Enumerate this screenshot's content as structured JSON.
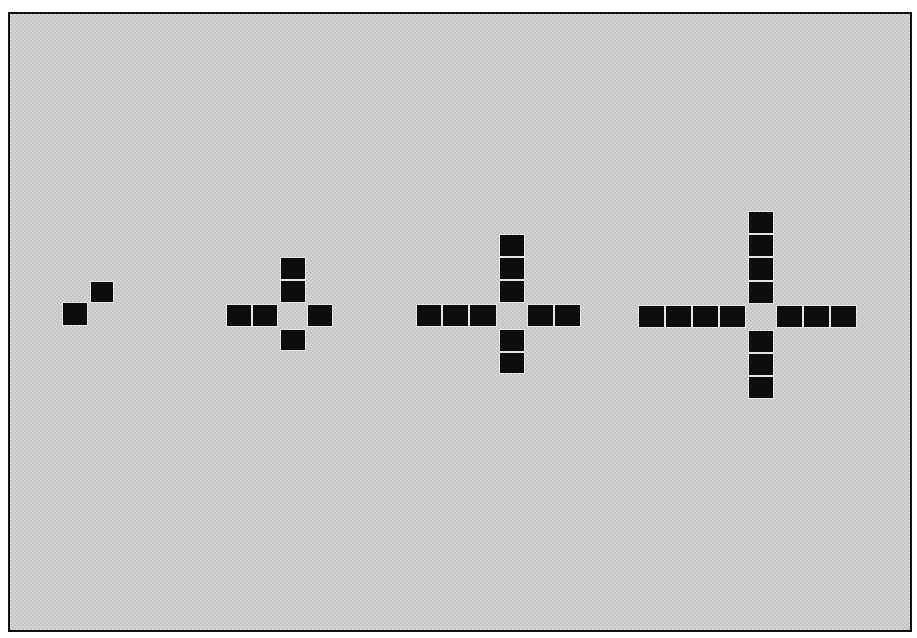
{
  "figure": {
    "background_color": "#d4d4d4",
    "border_color": "#111111",
    "cell_color": "#0d0d0d",
    "cell_size_px": 26
  },
  "shapes": [
    {
      "name": "shape-1-diagonal-pair",
      "cells": [
        {
          "x": 62,
          "y": 302,
          "w": 26,
          "h": 24
        },
        {
          "x": 90,
          "y": 281,
          "w": 24,
          "h": 22
        }
      ]
    },
    {
      "name": "shape-2-small-cross",
      "cells": [
        {
          "x": 280,
          "y": 257,
          "w": 26,
          "h": 23
        },
        {
          "x": 280,
          "y": 280,
          "w": 26,
          "h": 23
        },
        {
          "x": 226,
          "y": 304,
          "w": 26,
          "h": 23
        },
        {
          "x": 252,
          "y": 304,
          "w": 26,
          "h": 23
        },
        {
          "x": 307,
          "y": 304,
          "w": 26,
          "h": 23
        },
        {
          "x": 280,
          "y": 329,
          "w": 26,
          "h": 22
        }
      ]
    },
    {
      "name": "shape-3-medium-cross",
      "cells": [
        {
          "x": 499,
          "y": 234,
          "w": 26,
          "h": 23
        },
        {
          "x": 499,
          "y": 257,
          "w": 26,
          "h": 23
        },
        {
          "x": 499,
          "y": 280,
          "w": 26,
          "h": 23
        },
        {
          "x": 416,
          "y": 304,
          "w": 26,
          "h": 23
        },
        {
          "x": 442,
          "y": 304,
          "w": 27,
          "h": 23
        },
        {
          "x": 469,
          "y": 304,
          "w": 28,
          "h": 23
        },
        {
          "x": 527,
          "y": 304,
          "w": 27,
          "h": 23
        },
        {
          "x": 554,
          "y": 304,
          "w": 27,
          "h": 23
        },
        {
          "x": 499,
          "y": 329,
          "w": 26,
          "h": 23
        },
        {
          "x": 499,
          "y": 352,
          "w": 26,
          "h": 22
        }
      ]
    },
    {
      "name": "shape-4-large-cross",
      "cells": [
        {
          "x": 748,
          "y": 211,
          "w": 26,
          "h": 23
        },
        {
          "x": 748,
          "y": 234,
          "w": 26,
          "h": 23
        },
        {
          "x": 748,
          "y": 257,
          "w": 26,
          "h": 24
        },
        {
          "x": 748,
          "y": 281,
          "w": 26,
          "h": 23
        },
        {
          "x": 638,
          "y": 305,
          "w": 27,
          "h": 23
        },
        {
          "x": 665,
          "y": 305,
          "w": 27,
          "h": 23
        },
        {
          "x": 692,
          "y": 305,
          "w": 27,
          "h": 23
        },
        {
          "x": 719,
          "y": 305,
          "w": 27,
          "h": 23
        },
        {
          "x": 776,
          "y": 305,
          "w": 27,
          "h": 23
        },
        {
          "x": 803,
          "y": 305,
          "w": 27,
          "h": 23
        },
        {
          "x": 830,
          "y": 305,
          "w": 27,
          "h": 23
        },
        {
          "x": 748,
          "y": 330,
          "w": 26,
          "h": 23
        },
        {
          "x": 748,
          "y": 353,
          "w": 26,
          "h": 23
        },
        {
          "x": 748,
          "y": 376,
          "w": 26,
          "h": 23
        }
      ]
    }
  ]
}
